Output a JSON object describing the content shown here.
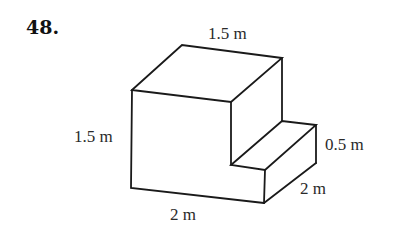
{
  "problem": {
    "number": "48."
  },
  "figure": {
    "type": "L-shaped solid (step block)",
    "dimensions": {
      "top_depth": "1.5 m",
      "front_height": "1.5 m",
      "step_height": "0.5 m",
      "step_depth": "2 m",
      "bottom_width": "2 m"
    },
    "stroke_color": "#1a1a1a",
    "label_color": "#2a2a2a"
  }
}
